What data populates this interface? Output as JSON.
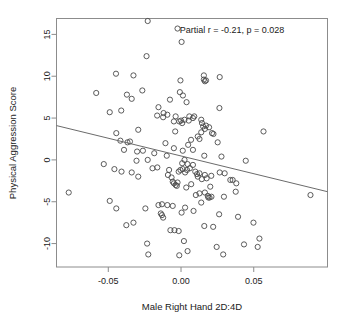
{
  "chart_data": {
    "type": "scatter",
    "title": "",
    "xlabel": "Male Right Hand 2D:4D",
    "ylabel": "Physical Aggression Score",
    "xlim": [
      -0.0856,
      0.1007
    ],
    "ylim": [
      -12.8,
      16.9
    ],
    "grid": false,
    "legend": null,
    "xticks": [
      -0.05,
      0.0,
      0.05
    ],
    "xticklabels": [
      "-0.05",
      "0.00",
      "0.05"
    ],
    "yticks": [
      -10,
      -5,
      0,
      5,
      10,
      15
    ],
    "yticklabels": [
      "-10",
      "-5",
      "0",
      "5",
      "10",
      "15"
    ],
    "annotations": [
      {
        "text": "Partial r = -0.21, p = 0.028",
        "x": 0.035,
        "y": 15.2
      }
    ],
    "statistics": {
      "partial_r": -0.21,
      "p_value": 0.028,
      "n_points": 155
    },
    "trendline": {
      "type": "linear",
      "x0": -0.0856,
      "y0": 4.1,
      "x1": 0.1007,
      "y1": -3.8,
      "slope": -42.4,
      "intercept": 0.47
    },
    "marker": {
      "shape": "open-circle",
      "radius_px": 2.6,
      "color": "#4a4a4a"
    },
    "points": [
      [
        -0.0229,
        16.6
      ],
      [
        -0.0024,
        15.7
      ],
      [
        0.0004,
        14.1
      ],
      [
        -0.0237,
        12.4
      ],
      [
        -0.0447,
        10.3
      ],
      [
        -0.0327,
        10.1
      ],
      [
        0.0157,
        10.1
      ],
      [
        0.0157,
        9.6
      ],
      [
        0.0266,
        9.9
      ],
      [
        0.0172,
        9.5
      ],
      [
        0.0164,
        9.4
      ],
      [
        -0.0004,
        9.5
      ],
      [
        -0.0583,
        8.0
      ],
      [
        -0.0266,
        8.3
      ],
      [
        -0.0372,
        7.8
      ],
      [
        -0.0339,
        7.3
      ],
      [
        -0.0008,
        8.1
      ],
      [
        0.0013,
        7.7
      ],
      [
        0.0038,
        6.9
      ],
      [
        -0.0076,
        7.2
      ],
      [
        -0.0411,
        5.9
      ],
      [
        -0.049,
        5.7
      ],
      [
        -0.012,
        5.6
      ],
      [
        -0.0155,
        6.3
      ],
      [
        -0.0164,
        5.3
      ],
      [
        -0.0094,
        5.4
      ],
      [
        -0.0123,
        5.1
      ],
      [
        -0.0037,
        5.2
      ],
      [
        -0.0049,
        4.6
      ],
      [
        0.0057,
        5.2
      ],
      [
        0.0082,
        5.0
      ],
      [
        0.0091,
        5.2
      ],
      [
        0.0139,
        4.8
      ],
      [
        0.0144,
        4.4
      ],
      [
        0.0152,
        4.0
      ],
      [
        0.0172,
        4.1
      ],
      [
        0.0193,
        3.9
      ],
      [
        0.0164,
        3.7
      ],
      [
        0.0139,
        3.3
      ],
      [
        0.0115,
        2.8
      ],
      [
        0.0127,
        2.5
      ],
      [
        0.0053,
        4.7
      ],
      [
        0.0024,
        4.8
      ],
      [
        0.0008,
        4.4
      ],
      [
        0.0,
        4.7
      ],
      [
        -0.0012,
        4.6
      ],
      [
        0.0264,
        6.2
      ],
      [
        0.0213,
        3.2
      ],
      [
        0.0223,
        3.1
      ],
      [
        0.0252,
        2.1
      ],
      [
        0.0567,
        3.4
      ],
      [
        -0.0445,
        3.2
      ],
      [
        -0.0294,
        3.6
      ],
      [
        -0.0351,
        2.2
      ],
      [
        -0.0368,
        2.1
      ],
      [
        -0.0417,
        2.3
      ],
      [
        -0.0392,
        1.2
      ],
      [
        -0.0302,
        1.0
      ],
      [
        -0.0262,
        1.1
      ],
      [
        -0.0184,
        0.8
      ],
      [
        -0.0229,
        0.0
      ],
      [
        -0.0098,
        0.5
      ],
      [
        -0.004,
        3.4
      ],
      [
        -0.0049,
        1.4
      ],
      [
        0.0049,
        1.8
      ],
      [
        0.0069,
        2.4
      ],
      [
        0.0024,
        0.0
      ],
      [
        0.0008,
        -0.4
      ],
      [
        0.0045,
        -0.5
      ],
      [
        0.0278,
        0.4
      ],
      [
        0.0445,
        -0.1
      ],
      [
        -0.0531,
        -0.5
      ],
      [
        -0.0458,
        -1.1
      ],
      [
        -0.0409,
        -1.4
      ],
      [
        -0.0306,
        -0.1
      ],
      [
        -0.0339,
        -1.5
      ],
      [
        -0.0163,
        -0.9
      ],
      [
        -0.0196,
        -1.0
      ],
      [
        -0.0294,
        -2.0
      ],
      [
        -0.0082,
        -1.2
      ],
      [
        -0.009,
        -1.8
      ],
      [
        -0.0065,
        -2.1
      ],
      [
        -0.0057,
        -2.6
      ],
      [
        -0.0049,
        -2.8
      ],
      [
        -0.0037,
        -3.0
      ],
      [
        -0.0024,
        -2.7
      ],
      [
        -0.0016,
        -1.4
      ],
      [
        -0.0004,
        -1.2
      ],
      [
        0.0012,
        -1.1
      ],
      [
        0.0028,
        -1.5
      ],
      [
        0.0041,
        -1.2
      ],
      [
        0.0061,
        -1.0
      ],
      [
        0.0082,
        -0.6
      ],
      [
        0.0098,
        -1.4
      ],
      [
        0.011,
        -1.7
      ],
      [
        0.0127,
        -1.6
      ],
      [
        0.0143,
        -2.3
      ],
      [
        0.0164,
        -1.8
      ],
      [
        0.0176,
        -2.2
      ],
      [
        0.0201,
        -3.2
      ],
      [
        0.0164,
        -3.9
      ],
      [
        0.0184,
        -4.3
      ],
      [
        0.0188,
        -4.5
      ],
      [
        0.0266,
        -1.5
      ],
      [
        0.0355,
        -2.4
      ],
      [
        0.038,
        -2.8
      ],
      [
        0.089,
        -4.2
      ],
      [
        -0.0772,
        -3.9
      ],
      [
        -0.049,
        -4.9
      ],
      [
        -0.0445,
        -5.8
      ],
      [
        -0.0376,
        -7.8
      ],
      [
        -0.0327,
        -7.5
      ],
      [
        -0.0245,
        -5.8
      ],
      [
        -0.0155,
        -5.4
      ],
      [
        -0.0131,
        -5.3
      ],
      [
        -0.0139,
        -6.4
      ],
      [
        -0.0131,
        -6.6
      ],
      [
        -0.0123,
        -6.9
      ],
      [
        -0.0094,
        -5.4
      ],
      [
        -0.0057,
        -5.5
      ],
      [
        -0.0073,
        -8.4
      ],
      [
        -0.0045,
        -8.4
      ],
      [
        -0.0016,
        -8.5
      ],
      [
        0.0004,
        -6.3
      ],
      [
        0.0028,
        -5.7
      ],
      [
        0.002,
        -9.7
      ],
      [
        0.0045,
        -10.9
      ],
      [
        -0.0012,
        -11.4
      ],
      [
        -0.0225,
        -11.3
      ],
      [
        -0.0233,
        -10.0
      ],
      [
        0.0086,
        -6.1
      ],
      [
        0.0102,
        -4.2
      ],
      [
        0.0127,
        -4.0
      ],
      [
        0.0139,
        -5.1
      ],
      [
        0.016,
        -7.9
      ],
      [
        0.0221,
        -8.0
      ],
      [
        0.0196,
        -4.5
      ],
      [
        0.0209,
        -4.4
      ],
      [
        0.0295,
        -4.4
      ],
      [
        0.0262,
        -6.5
      ],
      [
        0.0245,
        -10.4
      ],
      [
        0.029,
        -11.3
      ],
      [
        0.0339,
        -2.4
      ],
      [
        0.0376,
        -3.8
      ],
      [
        0.0392,
        -6.8
      ],
      [
        0.0433,
        -10.1
      ],
      [
        0.0498,
        -7.5
      ],
      [
        0.0539,
        -9.4
      ],
      [
        0.0527,
        -10.4
      ],
      [
        0.0208,
        -1.9
      ],
      [
        0.0115,
        -2.0
      ],
      [
        0.007,
        -2.9
      ],
      [
        -0.0029,
        -3.1
      ],
      [
        0.0036,
        -3.3
      ],
      [
        0.016,
        0.5
      ],
      [
        -0.0107,
        2.0
      ],
      [
        0.0082,
        1.2
      ],
      [
        0.0012,
        1.1
      ],
      [
        0.03,
        -1.6
      ]
    ]
  }
}
